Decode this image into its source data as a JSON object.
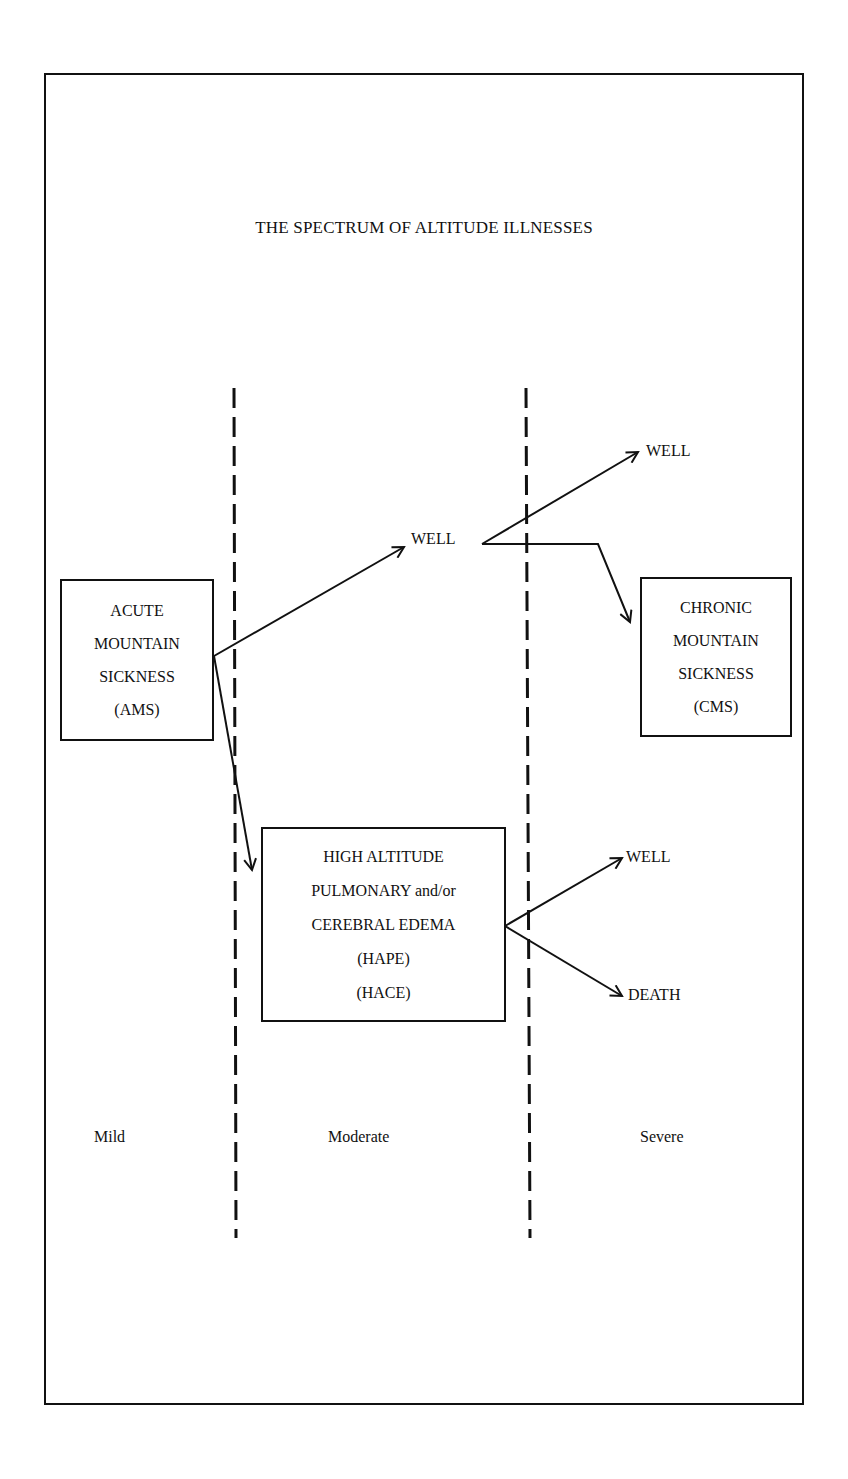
{
  "title": "THE SPECTRUM OF ALTITUDE ILLNESSES",
  "boxes": {
    "ams": {
      "lines": [
        "ACUTE",
        "MOUNTAIN",
        "SICKNESS",
        "(AMS)"
      ]
    },
    "cms": {
      "lines": [
        "CHRONIC",
        "MOUNTAIN",
        "SICKNESS",
        "(CMS)"
      ]
    },
    "hape": {
      "lines": [
        "HIGH ALTITUDE",
        "PULMONARY and/or",
        "CEREBRAL EDEMA",
        "(HAPE)",
        "(HACE)"
      ]
    }
  },
  "outcomes": {
    "well_middle": "WELL",
    "well_top_right": "WELL",
    "well_lower_right": "WELL",
    "death": "DEATH"
  },
  "severity_zones": [
    "Mild",
    "Moderate",
    "Severe"
  ],
  "colors": {
    "ink": "#111111",
    "background": "#ffffff"
  }
}
